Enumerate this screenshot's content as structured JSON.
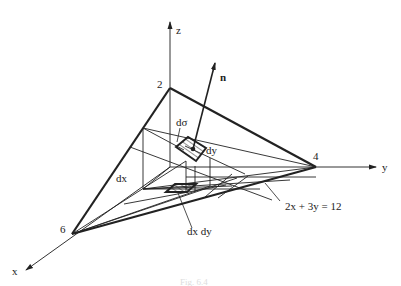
{
  "diagram": {
    "type": "3d-surface-projection",
    "axes": {
      "x": "x",
      "y": "y",
      "z": "z"
    },
    "intercepts": {
      "x": "6",
      "y": "4",
      "z": "2"
    },
    "normal_label": "n",
    "element_labels": {
      "surface_element": "dσ",
      "dx": "dx",
      "dy": "dy",
      "area_element": "dx dy"
    },
    "boundary_equation": "2x + 3y = 12",
    "caption": "Fig. 6.4"
  }
}
